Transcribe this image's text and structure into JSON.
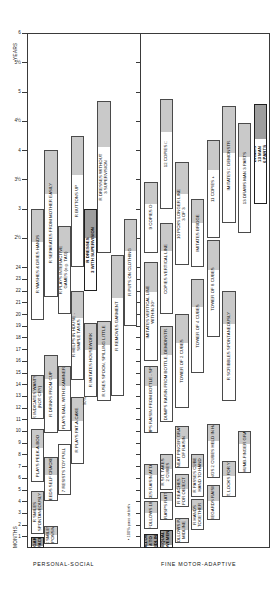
{
  "chart_data": {
    "type": "bar",
    "orientation": "rotated-90",
    "axis": {
      "months_label": "MONTHS",
      "years_label": "YEARS",
      "month_ticks": [
        "1",
        "2",
        "3",
        "4",
        "5",
        "6",
        "7",
        "8",
        "9",
        "10",
        "11",
        "12",
        "13",
        "14",
        "15",
        "16",
        "17",
        "18",
        "19",
        "20",
        "21",
        "22",
        "23",
        "24"
      ],
      "year_ticks": [
        "2½",
        "3",
        "3½",
        "4",
        "4½",
        "5",
        "5½",
        "6"
      ],
      "range_months": [
        0,
        24
      ],
      "range_years": [
        2.5,
        6
      ],
      "grid": false,
      "legend_position": "none"
    },
    "sections": [
      {
        "name": "personal-social",
        "label": "PERSONAL-SOCIAL"
      },
      {
        "name": "fine-motor-adaptive",
        "label": "FINE MOTOR-ADAPTIVE"
      }
    ],
    "notes": [
      {
        "name": "pass-at-birth",
        "text": "▪ 100% pass at birth"
      },
      {
        "name": "ninety-percent",
        "text": "90%"
      }
    ],
    "personal_social": [
      {
        "label": "REGARDS\nFACE",
        "start": 0.0,
        "end": 0.95,
        "fill": 0.85,
        "emphasis": true
      },
      {
        "label": "R SMILES\nRESPONSIVELY",
        "start": 0.3,
        "end": 1.9,
        "fill": 0.5
      },
      {
        "label": "R SMILES\nSPONTANEOUSLY",
        "start": 1.2,
        "end": 4.9,
        "fill": 0.45
      },
      {
        "label": "R FEEDS SELF CRACKERS",
        "start": 4.0,
        "end": 7.8,
        "fill": 0.4
      },
      {
        "label": "7 RESISTS TOY PULL",
        "start": 4.5,
        "end": 8.9,
        "fill": 0.0
      },
      {
        "label": "PLAYS PEEK-A-BOO",
        "start": 5.6,
        "end": 10.2,
        "fill": 0.35
      },
      {
        "label": "R PLAYS PAT-A-CAKE",
        "start": 7.2,
        "end": 12.9,
        "fill": 0.35
      },
      {
        "label": "R DRINKS FROM CUP",
        "start": 9.8,
        "end": 16.5,
        "fill": 0.3
      },
      {
        "label": "PLAYS BALL WITH EXAMINER",
        "start": 10.0,
        "end": 15.6,
        "fill": 0.3
      },
      {
        "label": "R INDICATES WANTS\n(NOT CRY)",
        "start": 11.0,
        "end": 14.8,
        "fill": 0.4
      },
      {
        "label": "R IMITATES HOUSEWORK",
        "start": 12.9,
        "end": 19.2,
        "fill": 0.35
      },
      {
        "label": "R USES SPOON, SPILLING LITTLE",
        "start": 12.6,
        "end": 19.4,
        "fill": 0.3
      },
      {
        "label": "R HELPS IN HOUSE -\nSIMPLE TASKS",
        "start": 14.4,
        "end": 22.0,
        "fill": 0.3
      },
      {
        "label": "R WASHES & DRIES HANDS",
        "start": 19.5,
        "end": 36.0,
        "fill": 0.3
      },
      {
        "label": "R SEPARATES FROM MOTHER EASILY",
        "start": 21.5,
        "end": 48.0,
        "fill": 0.3
      },
      {
        "label": "R PLAYS INTERACTIVE\nGAMES (e.g. TAG)",
        "start": 20.0,
        "end": 32.5,
        "fill": 0.3
      },
      {
        "label": "R REMOVES GARMENT",
        "start": 13.0,
        "end": 26.5,
        "fill": 0.3
      },
      {
        "label": "R PUTS ON CLOTHING",
        "start": 19.0,
        "end": 34.0,
        "fill": 0.3
      },
      {
        "label": "R DRESSES\n3 WITH SUPERVISION",
        "start": 22.0,
        "end": 36.0,
        "fill": 0.35,
        "emphasis": true
      },
      {
        "label": "R BUTTONS UP",
        "start": 24.0,
        "end": 51.0,
        "fill": 0.3
      },
      {
        "label": "R DRESSES WITHOUT\n3 SUPERVISION",
        "start": 27.0,
        "end": 58.0,
        "fill": 0.3
      }
    ],
    "fine_motor": [
      {
        "label": "FOLLOWS\n4 TO\nMIDLINE",
        "start": 0.0,
        "end": 1.2,
        "fill": 0.9,
        "emphasis": true
      },
      {
        "label": "EQUAL\nMOVEMENTS",
        "start": 0.0,
        "end": 1.5,
        "fill": 0.85,
        "emphasis": true
      },
      {
        "label": "4 FOLLOWS PAST\nMIDLINE",
        "start": 0.4,
        "end": 2.6,
        "fill": 0.5
      },
      {
        "label": "4 FOLLOWS 180°",
        "start": 1.6,
        "end": 4.0,
        "fill": 0.4
      },
      {
        "label": "R HANDS\nTOGETHER",
        "start": 1.5,
        "end": 4.2,
        "fill": 0.35
      },
      {
        "label": "5 GRASPS RATTLE",
        "start": 2.4,
        "end": 4.8,
        "fill": 0.3
      },
      {
        "label": "REGARDS RAISIN",
        "start": 2.4,
        "end": 5.4,
        "fill": 0.45
      },
      {
        "label": "R REACHES\nFOR OBJECT",
        "start": 3.5,
        "end": 6.3,
        "fill": 0.45
      },
      {
        "label": "RAKES RAISIN ATTAINS",
        "start": 4.2,
        "end": 7.2,
        "fill": 0.3
      },
      {
        "label": "R PASSES CUBE\nHAND TO HAND",
        "start": 4.4,
        "end": 8.0,
        "fill": 0.3
      },
      {
        "label": "R SIT, LOOKS FOR YARN",
        "start": 4.4,
        "end": 7.4,
        "fill": 0.4
      },
      {
        "label": "R SIT, TAKES\n2 CUBES",
        "start": 5.0,
        "end": 8.0,
        "fill": 0.4
      },
      {
        "label": "R BANGS 2 CUBES HELD IN HANDS",
        "start": 6.0,
        "end": 10.6,
        "fill": 0.3
      },
      {
        "label": "R NEAT PINCER GRASP\nOF RAISIN",
        "start": 6.8,
        "end": 10.4,
        "fill": 0.3
      },
      {
        "label": "7 THUMB-FINGER GRASP",
        "start": 6.4,
        "end": 10.0,
        "fill": 0.3
      },
      {
        "label": "DUMPS RAISIN FROM BOTTLE - SPONT.",
        "start": 9.8,
        "end": 15.6,
        "fill": 0.3
      },
      {
        "label": "DUMPS RAISIN FROM BOTTLE, DEMONSTR.",
        "start": 10.8,
        "end": 19.0,
        "fill": 0.3
      },
      {
        "label": "IMITATES VERTICAL LINE\nWITHIN 30°",
        "start": 16.0,
        "end": 25.0,
        "fill": 0.3
      },
      {
        "label": "TOWER OF 2 CUBES",
        "start": 12.0,
        "end": 20.0,
        "fill": 0.3
      },
      {
        "label": "TOWER OF 4 CUBES",
        "start": 15.0,
        "end": 23.0,
        "fill": 0.3
      },
      {
        "label": "TOWER OF 8 CUBES",
        "start": 18.0,
        "end": 29.5,
        "fill": 0.3
      },
      {
        "label": "R SCRIBBLES SPONTANEOUSLY",
        "start": 12.6,
        "end": 22.0,
        "fill": 0.3
      },
      {
        "label": "COPIES VERTICAL LINE",
        "start": 20.0,
        "end": 33.0,
        "fill": 0.3
      },
      {
        "label": "10 PICKS LONGER LINE\n3 OF 3",
        "start": 24.5,
        "end": 45.5,
        "fill": 0.3
      },
      {
        "label": "IMITATES BRIDGE",
        "start": 24.0,
        "end": 38.0,
        "fill": 0.35
      },
      {
        "label": "9 COPIES O",
        "start": 27.0,
        "end": 41.5,
        "fill": 0.3
      },
      {
        "label": "11 COPIES +",
        "start": 30.0,
        "end": 50.0,
        "fill": 0.3
      },
      {
        "label": "IMITATES □ DEMONSTR.",
        "start": 33.0,
        "end": 57.0,
        "fill": 0.4
      },
      {
        "label": "12 COPIES □",
        "start": 36.0,
        "end": 58.5,
        "fill": 0.3
      },
      {
        "label": "13 DRAWS MAN 3 PARTS",
        "start": 31.0,
        "end": 53.5,
        "fill": 0.3
      },
      {
        "label": "DRAWS\n13 MAN\n6 PARTS",
        "start": 37.0,
        "end": 57.5,
        "fill": 0.35,
        "emphasis": true
      }
    ]
  }
}
